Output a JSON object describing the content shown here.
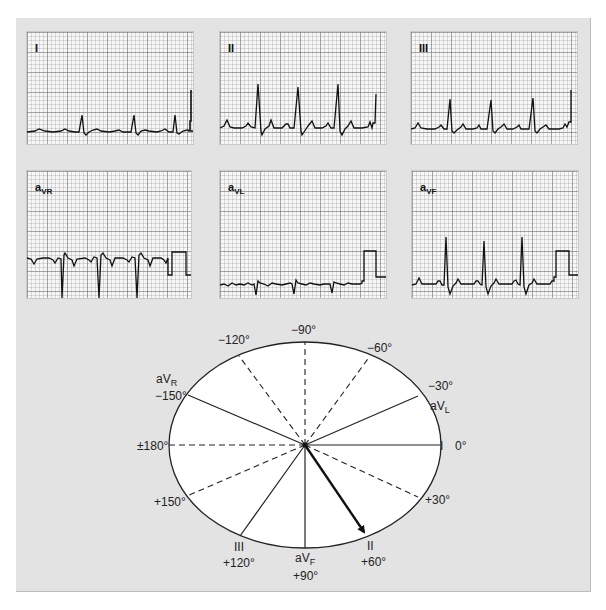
{
  "leads": [
    {
      "id": "I",
      "label": "I",
      "sub": ""
    },
    {
      "id": "II",
      "label": "II",
      "sub": ""
    },
    {
      "id": "III",
      "label": "III",
      "sub": ""
    },
    {
      "id": "aVR",
      "label": "a",
      "sub": "VR"
    },
    {
      "id": "aVL",
      "label": "a",
      "sub": "VL"
    },
    {
      "id": "aVF",
      "label": "a",
      "sub": "VF"
    }
  ],
  "hexaxial": {
    "labels": {
      "m90": "−90°",
      "m120": "−120°",
      "m60": "−60°",
      "avr": "aV",
      "avr_sub": "R",
      "m150": "−150°",
      "m30": "−30°",
      "avl": "aV",
      "avl_sub": "L",
      "p180": "±180°",
      "leadI": "I",
      "zero": "0°",
      "p150": "+150°",
      "p30": "+30°",
      "leadIII": "III",
      "p120": "+120°",
      "avf": "aV",
      "avf_sub": "F",
      "p90": "+90°",
      "leadII": "II",
      "p60": "+60°"
    },
    "axis_arrow_degrees": 60,
    "solid_axes_degrees": [
      0,
      60,
      120,
      -150,
      -30,
      90
    ],
    "dashed_axes_degrees": [
      -90,
      -60,
      -120,
      180,
      150,
      30
    ]
  }
}
